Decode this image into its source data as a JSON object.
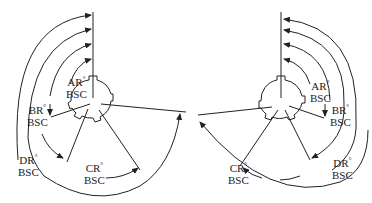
{
  "diagram": {
    "type": "angular-position-diagram",
    "stroke_color": "#222222",
    "background": "#ffffff",
    "left_view": {
      "direction": "counter-clockwise from vertical reference",
      "labels": [
        {
          "id": "AR",
          "line1": "AR",
          "sup": "°",
          "line2": "BSC"
        },
        {
          "id": "BR",
          "line1": "BR",
          "sup": "°",
          "line2": "BSC"
        },
        {
          "id": "CR",
          "line1": "CR",
          "sup": "°",
          "line2": "BSC"
        },
        {
          "id": "DR",
          "line1": "DR",
          "sup": "°",
          "line2": "BSC"
        }
      ]
    },
    "right_view": {
      "direction": "clockwise from vertical reference",
      "labels": [
        {
          "id": "AR",
          "line1": "AR",
          "sup": "°",
          "line2": "BSC"
        },
        {
          "id": "BR",
          "line1": "BR",
          "sup": "°",
          "line2": "BSC"
        },
        {
          "id": "CR",
          "line1": "CR",
          "sup": "°",
          "line2": "BSC"
        },
        {
          "id": "DR",
          "line1": "DR",
          "sup": "°",
          "line2": "BSC"
        }
      ]
    }
  }
}
